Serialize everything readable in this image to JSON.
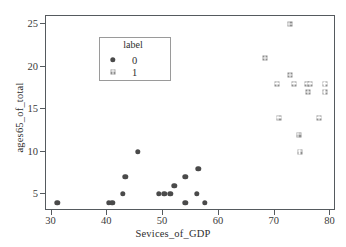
{
  "chart_data": {
    "type": "scatter",
    "title": "",
    "xlabel": "Sevices_of_GDP",
    "ylabel": "ages65_of_total",
    "xlim": [
      29.0,
      81.0
    ],
    "ylim": [
      3.0,
      26.0
    ],
    "xticks": [
      30,
      40,
      50,
      60,
      70,
      80
    ],
    "yticks": [
      5,
      10,
      15,
      20,
      25
    ],
    "xticklabels": [
      "30",
      "40",
      "50",
      "60",
      "70",
      "80"
    ],
    "yticklabels": [
      "5",
      "10",
      "15",
      "20",
      "25"
    ],
    "grid": false,
    "legend": {
      "title": "label",
      "position": "upper-left-inside",
      "entries": [
        {
          "label": "0",
          "marker": "circle",
          "color": "#4a4a4a"
        },
        {
          "label": "1",
          "marker": "square-x",
          "color": "#8e8e8e"
        }
      ]
    },
    "series": [
      {
        "name": "0",
        "marker": "circle",
        "color": "#4a4a4a",
        "points": [
          [
            31.0,
            4
          ],
          [
            40.3,
            4
          ],
          [
            40.9,
            4
          ],
          [
            42.8,
            5
          ],
          [
            43.2,
            7
          ],
          [
            45.5,
            10
          ],
          [
            49.2,
            5
          ],
          [
            50.2,
            5
          ],
          [
            51.3,
            5
          ],
          [
            52.0,
            6
          ],
          [
            54.0,
            7
          ],
          [
            54.0,
            4
          ],
          [
            56.0,
            5
          ],
          [
            56.3,
            8
          ],
          [
            57.5,
            4
          ]
        ]
      },
      {
        "name": "1",
        "marker": "square-x",
        "color": "#8e8e8e",
        "points": [
          [
            68.3,
            21
          ],
          [
            70.5,
            18
          ],
          [
            70.7,
            14
          ],
          [
            72.7,
            25
          ],
          [
            72.8,
            19
          ],
          [
            73.5,
            18
          ],
          [
            74.3,
            12
          ],
          [
            74.5,
            10
          ],
          [
            75.8,
            18
          ],
          [
            76.0,
            17
          ],
          [
            76.4,
            18
          ],
          [
            78.0,
            14
          ],
          [
            79.0,
            18
          ],
          [
            79.0,
            17
          ]
        ]
      }
    ]
  },
  "colors": {
    "class0": "#4a4a4a",
    "class1": "#8e8e8e",
    "axis": "#555a5e",
    "text": "#2e2e2e",
    "background": "#ffffff"
  }
}
